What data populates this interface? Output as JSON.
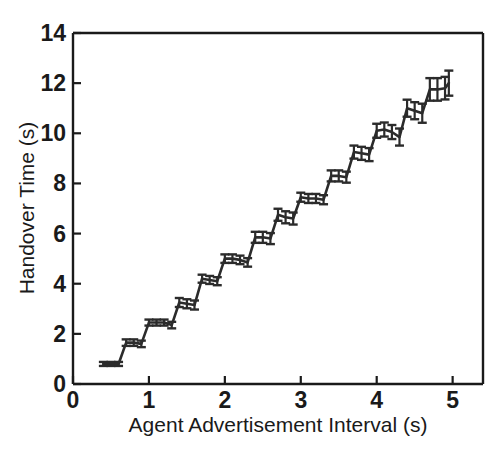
{
  "figure": {
    "name": "handover-time-line-chart",
    "background_color": "#ffffff",
    "foreground_color": "#1a1a1a"
  },
  "chart_data": {
    "type": "line",
    "title": "",
    "subtitle": "",
    "xlabel": "Agent Advertisement Interval (s)",
    "ylabel": "Handover Time (s)",
    "xlim": [
      0,
      5.4
    ],
    "ylim": [
      0,
      14
    ],
    "xticks": [
      0,
      1,
      2,
      3,
      4,
      5
    ],
    "xtick_labels": [
      "0",
      "1",
      "2",
      "3",
      "4",
      "5"
    ],
    "yticks": [
      0,
      2,
      4,
      6,
      8,
      10,
      12,
      14
    ],
    "ytick_labels": [
      "0",
      "2",
      "4",
      "6",
      "8",
      "10",
      "12",
      "14"
    ],
    "grid": false,
    "legend": null,
    "line_color": "#2b2b2b",
    "line_width": 2.6,
    "error_bar_color": "#2b2b2b",
    "error_bar_cap_width": 9,
    "series": [
      {
        "name": "Handover Time",
        "x": [
          0.4,
          0.5,
          0.6,
          0.7,
          0.8,
          0.9,
          1.0,
          1.1,
          1.2,
          1.3,
          1.4,
          1.5,
          1.6,
          1.7,
          1.8,
          1.9,
          2.0,
          2.1,
          2.2,
          2.3,
          2.4,
          2.5,
          2.6,
          2.7,
          2.8,
          2.9,
          3.0,
          3.1,
          3.2,
          3.3,
          3.4,
          3.5,
          3.6,
          3.7,
          3.8,
          3.9,
          4.0,
          4.1,
          4.2,
          4.3,
          4.4,
          4.5,
          4.6,
          4.7,
          4.8,
          4.9,
          4.95
        ],
        "y": [
          0.8,
          0.8,
          0.8,
          1.65,
          1.65,
          1.6,
          2.45,
          2.45,
          2.45,
          2.35,
          3.25,
          3.2,
          3.15,
          4.2,
          4.15,
          4.1,
          5.0,
          5.0,
          4.95,
          4.85,
          5.85,
          5.85,
          5.8,
          6.75,
          6.65,
          6.6,
          7.45,
          7.4,
          7.4,
          7.35,
          8.3,
          8.3,
          8.25,
          9.25,
          9.2,
          9.15,
          10.1,
          10.15,
          10.05,
          9.85,
          11.0,
          10.9,
          10.8,
          11.75,
          11.75,
          11.8,
          12.0
        ],
        "yerr": [
          0.08,
          0.08,
          0.08,
          0.13,
          0.13,
          0.13,
          0.12,
          0.12,
          0.12,
          0.13,
          0.18,
          0.18,
          0.18,
          0.16,
          0.16,
          0.16,
          0.17,
          0.17,
          0.17,
          0.17,
          0.22,
          0.22,
          0.22,
          0.24,
          0.24,
          0.24,
          0.18,
          0.18,
          0.18,
          0.18,
          0.22,
          0.22,
          0.22,
          0.26,
          0.26,
          0.26,
          0.28,
          0.28,
          0.28,
          0.34,
          0.34,
          0.34,
          0.38,
          0.45,
          0.45,
          0.45,
          0.5
        ]
      }
    ]
  }
}
